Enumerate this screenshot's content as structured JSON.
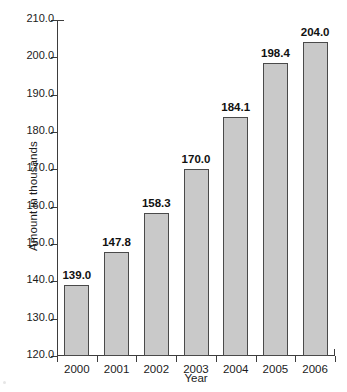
{
  "chart_data": {
    "type": "bar",
    "title": "",
    "xlabel": "Year",
    "ylabel": "Amount in thousands",
    "categories": [
      "2000",
      "2001",
      "2002",
      "2003",
      "2004",
      "2005",
      "2006"
    ],
    "values": [
      139.0,
      147.8,
      158.3,
      170.0,
      184.1,
      198.4,
      204.0
    ],
    "data_labels": [
      "139.0",
      "147.8",
      "158.3",
      "170.0",
      "184.1",
      "198.4",
      "204.0"
    ],
    "ylim": [
      120.0,
      210.0
    ],
    "ytick_step": 10.0,
    "ytick_labels": [
      "210.0",
      "200.0",
      "190.0",
      "180.0",
      "170.0",
      "160.0",
      "150.0",
      "140.0",
      "130.0",
      "120.0"
    ],
    "ytick_values": [
      210.0,
      200.0,
      190.0,
      180.0,
      170.0,
      160.0,
      150.0,
      140.0,
      130.0,
      120.0
    ],
    "grid": false,
    "legend": null,
    "bar_fill_color": "#c9c9c9",
    "bar_border_color": "#4a4a4a",
    "axis_color": "#3d3d3d",
    "text_color": "#1b1b1b",
    "background_color": "#ffffff"
  }
}
